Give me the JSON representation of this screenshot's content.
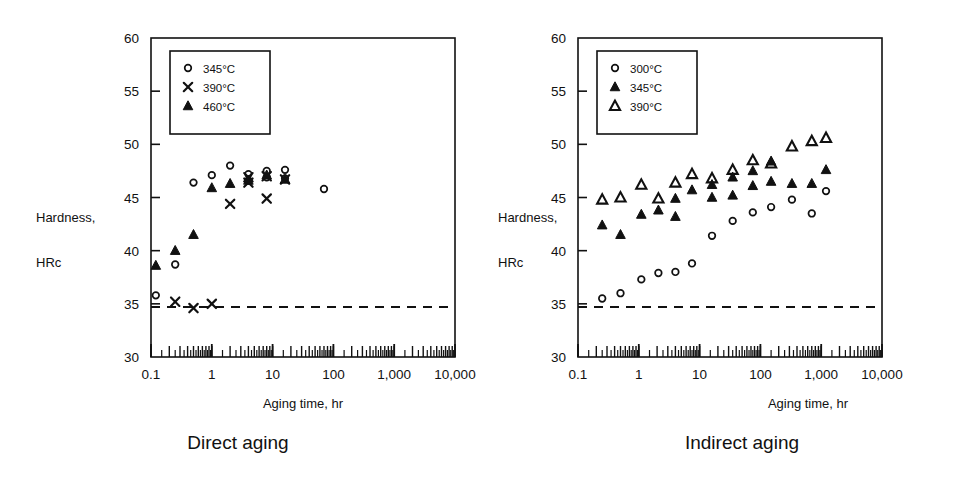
{
  "figure": {
    "background": "#ffffff",
    "ink": "#111111"
  },
  "panels": [
    {
      "id": "direct",
      "caption": "Direct aging",
      "chart_data": {
        "type": "scatter",
        "title": "",
        "xlabel": "Aging time, hr",
        "ylabel": "Hardness,\nHRc",
        "ylabel_line1": "Hardness,",
        "ylabel_line2": "HRc",
        "xscale": "log",
        "xlim": [
          0.1,
          10000
        ],
        "ylim": [
          30,
          60
        ],
        "xticks": [
          0.1,
          1,
          10,
          100,
          1000,
          10000
        ],
        "xticklabels": [
          "0.1",
          "1",
          "10",
          "100",
          "1,000",
          "10,000"
        ],
        "yticks": [
          30,
          35,
          40,
          45,
          50,
          55,
          60
        ],
        "yticklabels": [
          "30",
          "35",
          "40",
          "45",
          "50",
          "55",
          "60"
        ],
        "grid": false,
        "minor_ticks": true,
        "legend_position": "upper-left",
        "reference_line": {
          "value": 34.7,
          "style": "dashed",
          "label": ""
        },
        "series": [
          {
            "name": "345°C",
            "marker": "open-circle",
            "points": [
              [
                0.12,
                35.8
              ],
              [
                0.25,
                38.7
              ],
              [
                0.5,
                46.4
              ],
              [
                1.0,
                47.1
              ],
              [
                2.0,
                48.0
              ],
              [
                4.0,
                47.2
              ],
              [
                4.0,
                46.6
              ],
              [
                8.0,
                47.5
              ],
              [
                8.0,
                46.9
              ],
              [
                16.0,
                47.6
              ],
              [
                16.0,
                46.8
              ],
              [
                70.0,
                45.8
              ]
            ]
          },
          {
            "name": "390°C",
            "marker": "cross",
            "points": [
              [
                0.25,
                35.2
              ],
              [
                0.5,
                34.6
              ],
              [
                1.0,
                35.0
              ],
              [
                2.0,
                44.4
              ],
              [
                4.0,
                46.9
              ],
              [
                4.0,
                46.4
              ],
              [
                8.0,
                44.9
              ],
              [
                8.0,
                47.0
              ],
              [
                16.0,
                46.7
              ]
            ]
          },
          {
            "name": "460°C",
            "marker": "filled-triangle",
            "points": [
              [
                0.12,
                38.6
              ],
              [
                0.25,
                40.0
              ],
              [
                0.5,
                41.5
              ],
              [
                1.0,
                45.9
              ],
              [
                2.0,
                46.3
              ],
              [
                4.0,
                46.6
              ],
              [
                8.0,
                47.1
              ],
              [
                16.0,
                46.7
              ]
            ]
          }
        ]
      }
    },
    {
      "id": "indirect",
      "caption": "Indirect aging",
      "chart_data": {
        "type": "scatter",
        "title": "",
        "xlabel": "Aging time, hr",
        "ylabel": "Hardness,\nHRc",
        "ylabel_line1": "Hardness,",
        "ylabel_line2": "HRc",
        "xscale": "log",
        "xlim": [
          0.1,
          10000
        ],
        "ylim": [
          30,
          60
        ],
        "xticks": [
          0.1,
          1,
          10,
          100,
          1000,
          10000
        ],
        "xticklabels": [
          "0.1",
          "1",
          "10",
          "100",
          "1,000",
          "10,000"
        ],
        "yticks": [
          30,
          35,
          40,
          45,
          50,
          55,
          60
        ],
        "yticklabels": [
          "30",
          "35",
          "40",
          "45",
          "50",
          "55",
          "60"
        ],
        "grid": false,
        "minor_ticks": true,
        "legend_position": "upper-left",
        "reference_line": {
          "value": 34.7,
          "style": "dashed",
          "label": ""
        },
        "series": [
          {
            "name": "300°C",
            "marker": "open-circle",
            "points": [
              [
                0.25,
                35.5
              ],
              [
                0.5,
                36.0
              ],
              [
                1.1,
                37.3
              ],
              [
                2.1,
                37.9
              ],
              [
                4.0,
                38.0
              ],
              [
                7.5,
                38.8
              ],
              [
                16.0,
                41.4
              ],
              [
                35.0,
                42.8
              ],
              [
                75.0,
                43.6
              ],
              [
                150.0,
                44.1
              ],
              [
                330.0,
                44.8
              ],
              [
                700.0,
                43.5
              ],
              [
                1200.0,
                45.6
              ]
            ]
          },
          {
            "name": "345°C",
            "marker": "filled-triangle",
            "points": [
              [
                0.25,
                42.4
              ],
              [
                0.5,
                41.5
              ],
              [
                1.1,
                43.4
              ],
              [
                2.1,
                43.8
              ],
              [
                4.0,
                44.9
              ],
              [
                4.0,
                43.2
              ],
              [
                7.5,
                45.7
              ],
              [
                16.0,
                46.2
              ],
              [
                16.0,
                45.0
              ],
              [
                35.0,
                46.9
              ],
              [
                35.0,
                45.2
              ],
              [
                75.0,
                47.5
              ],
              [
                75.0,
                46.1
              ],
              [
                150.0,
                48.4
              ],
              [
                150.0,
                46.5
              ],
              [
                330.0,
                46.3
              ],
              [
                700.0,
                46.3
              ],
              [
                1200.0,
                47.6
              ]
            ]
          },
          {
            "name": "390°C",
            "marker": "open-triangle",
            "points": [
              [
                0.25,
                44.8
              ],
              [
                0.5,
                45.0
              ],
              [
                1.1,
                46.2
              ],
              [
                2.1,
                44.9
              ],
              [
                4.0,
                46.4
              ],
              [
                7.5,
                47.2
              ],
              [
                16.0,
                46.8
              ],
              [
                35.0,
                47.6
              ],
              [
                75.0,
                48.5
              ],
              [
                150.0,
                48.2
              ],
              [
                330.0,
                49.8
              ],
              [
                700.0,
                50.3
              ],
              [
                1200.0,
                50.6
              ]
            ]
          }
        ]
      }
    }
  ]
}
